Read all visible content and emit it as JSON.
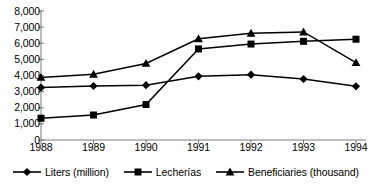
{
  "chart_data": {
    "type": "line",
    "title": "",
    "subtitle": "",
    "xlabel": "",
    "ylabel": "",
    "categories": [
      "1988",
      "1989",
      "1990",
      "1991",
      "1992",
      "1993",
      "1994"
    ],
    "x": [
      1988,
      1989,
      1990,
      1991,
      1992,
      1993,
      1994
    ],
    "ylim": [
      0,
      8000
    ],
    "ytick_values": [
      0,
      1000,
      2000,
      3000,
      4000,
      5000,
      6000,
      7000,
      8000
    ],
    "ytick_labels": [
      "0",
      "1,000",
      "2,000",
      "3,000",
      "4,000",
      "5,000",
      "6,000",
      "7,000",
      "8,000"
    ],
    "grid": false,
    "legend_position": "bottom",
    "line_color": "#000000",
    "series": [
      {
        "name": "Liters (million)",
        "marker": "diamond",
        "color": "#000000",
        "values": [
          3250,
          3350,
          3400,
          3950,
          4050,
          3780,
          3330
        ]
      },
      {
        "name": "Lecherías",
        "marker": "square",
        "color": "#000000",
        "values": [
          1350,
          1550,
          2200,
          5650,
          5950,
          6120,
          6250
        ]
      },
      {
        "name": "Beneficiaries (thousand)",
        "marker": "triangle",
        "color": "#000000",
        "values": [
          3880,
          4080,
          4750,
          6280,
          6620,
          6700,
          4800
        ]
      }
    ]
  },
  "legend": {
    "items": [
      {
        "label": "Liters (million)",
        "marker": "diamond"
      },
      {
        "label": "Lecherías",
        "marker": "square"
      },
      {
        "label": "Beneficiaries (thousand)",
        "marker": "triangle"
      }
    ]
  }
}
